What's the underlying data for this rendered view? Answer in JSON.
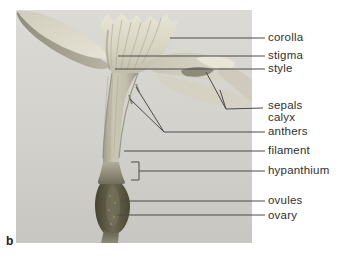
{
  "figure": {
    "panel_letter": "b",
    "labels": [
      {
        "id": "corolla",
        "text": "corolla"
      },
      {
        "id": "stigma",
        "text": "stigma"
      },
      {
        "id": "style",
        "text": "style"
      },
      {
        "id": "sepals",
        "text": "sepals"
      },
      {
        "id": "calyx",
        "text": "calyx"
      },
      {
        "id": "anthers",
        "text": "anthers"
      },
      {
        "id": "filament",
        "text": "filament"
      },
      {
        "id": "hypanthium",
        "text": "hypanthium"
      },
      {
        "id": "ovules",
        "text": "ovules"
      },
      {
        "id": "ovary",
        "text": "ovary"
      }
    ],
    "colors": {
      "page_background": "#ffffff",
      "photo_background_top": "#dbdad5",
      "photo_background_bottom": "#c7c6c0",
      "label_text": "#2f2f2f",
      "leader_line": "#4b4b4b",
      "petal_light": "#e9e6d8",
      "petal_shadow": "#9b9785",
      "ovary_dark": "#45422f",
      "stem": "#8e8c79"
    }
  }
}
